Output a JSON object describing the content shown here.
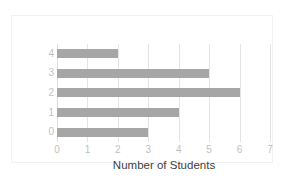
{
  "chart_data": {
    "type": "bar",
    "orientation": "horizontal",
    "title": "",
    "xlabel": "Number of Students",
    "ylabel": "Hours Studied",
    "categories": [
      "4",
      "3",
      "2",
      "1",
      "0"
    ],
    "values": [
      2,
      5,
      6,
      4,
      3
    ],
    "series": [
      {
        "name": "Number of Students",
        "values": [
          2,
          5,
          6,
          4,
          3
        ]
      }
    ],
    "xlim": [
      0,
      7
    ],
    "xticks": [
      "0",
      "1",
      "2",
      "3",
      "4",
      "5",
      "6",
      "7"
    ],
    "yticks": [
      "4",
      "3",
      "2",
      "1",
      "0"
    ],
    "grid": "vertical",
    "legend": "none",
    "colors": {
      "bar": "#a6a6a6",
      "gridline": "#e4e4e4",
      "tick_label": "#bfbfbf",
      "axis_title": "#404040",
      "background": "#ffffff",
      "border": "#f2f2f2"
    }
  }
}
